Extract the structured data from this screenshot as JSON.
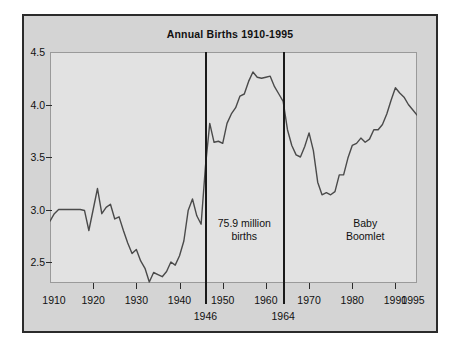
{
  "chart_data": {
    "type": "line",
    "title": "Annual Births 1910-1995",
    "xlabel": "",
    "ylabel": "",
    "xlim": [
      1910,
      1995
    ],
    "ylim": [
      2.3,
      4.5
    ],
    "grid": false,
    "legend": "none",
    "y_ticks": [
      "4.5",
      "4.0",
      "3.5",
      "3.0",
      "2.5"
    ],
    "y_tick_values": [
      4.5,
      4.0,
      3.5,
      3.0,
      2.5
    ],
    "x_ticks": [
      "1910",
      "1920",
      "1930",
      "1940",
      "1950",
      "1960",
      "1970",
      "1980",
      "1990",
      "1995"
    ],
    "x_tick_values": [
      1910,
      1920,
      1930,
      1940,
      1950,
      1960,
      1970,
      1980,
      1990,
      1995
    ],
    "series": [
      {
        "name": "Annual births (millions)",
        "x": [
          1910,
          1911,
          1912,
          1913,
          1914,
          1915,
          1916,
          1917,
          1918,
          1919,
          1920,
          1921,
          1922,
          1923,
          1924,
          1925,
          1926,
          1927,
          1928,
          1929,
          1930,
          1931,
          1932,
          1933,
          1934,
          1935,
          1936,
          1937,
          1938,
          1939,
          1940,
          1941,
          1942,
          1943,
          1944,
          1945,
          1946,
          1947,
          1948,
          1949,
          1950,
          1951,
          1952,
          1953,
          1954,
          1955,
          1956,
          1957,
          1958,
          1959,
          1960,
          1961,
          1962,
          1963,
          1964,
          1965,
          1966,
          1967,
          1968,
          1969,
          1970,
          1971,
          1972,
          1973,
          1974,
          1975,
          1976,
          1977,
          1978,
          1979,
          1980,
          1981,
          1982,
          1983,
          1984,
          1985,
          1986,
          1987,
          1988,
          1989,
          1990,
          1991,
          1992,
          1993,
          1994,
          1995
        ],
        "y": [
          2.89,
          2.96,
          3.0,
          3.0,
          3.0,
          3.0,
          3.0,
          3.0,
          2.99,
          2.8,
          3.0,
          3.2,
          2.96,
          3.02,
          3.05,
          2.91,
          2.93,
          2.8,
          2.68,
          2.58,
          2.62,
          2.51,
          2.44,
          2.31,
          2.4,
          2.38,
          2.36,
          2.41,
          2.5,
          2.47,
          2.56,
          2.7,
          2.99,
          3.1,
          2.94,
          2.86,
          3.41,
          3.82,
          3.64,
          3.65,
          3.63,
          3.82,
          3.91,
          3.97,
          4.08,
          4.1,
          4.22,
          4.31,
          4.26,
          4.25,
          4.26,
          4.27,
          4.17,
          4.1,
          4.03,
          3.76,
          3.61,
          3.52,
          3.5,
          3.6,
          3.73,
          3.56,
          3.26,
          3.14,
          3.16,
          3.14,
          3.17,
          3.33,
          3.33,
          3.49,
          3.61,
          3.63,
          3.68,
          3.64,
          3.67,
          3.76,
          3.76,
          3.81,
          3.91,
          4.04,
          4.16,
          4.11,
          4.07,
          4.0,
          3.95,
          3.9
        ]
      }
    ],
    "vertical_markers": [
      {
        "x": 1946,
        "label": "1946"
      },
      {
        "x": 1964,
        "label": "1964"
      }
    ],
    "annotations": [
      {
        "text": "75.9 million\nbirths",
        "x": 1955,
        "y": 2.93
      },
      {
        "text": "Baby\nBoomlet",
        "x": 1983,
        "y": 2.93
      }
    ],
    "watermark": ""
  },
  "colors": {
    "line": "#4a4a4a",
    "figure_background": "#d4d4d4",
    "plot_background": "#e2e2e2",
    "border": "#2b2b2b",
    "text": "#111111"
  }
}
